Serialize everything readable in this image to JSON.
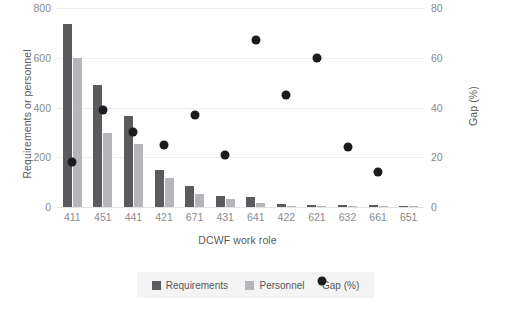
{
  "chart_data": {
    "type": "bar",
    "title": "",
    "xlabel": "DCWF work role",
    "ylabel": "Requirements or personnel",
    "y2label": "Gap (%)",
    "categories": [
      "411",
      "451",
      "441",
      "421",
      "671",
      "431",
      "641",
      "422",
      "621",
      "632",
      "661",
      "651"
    ],
    "ylim": [
      0,
      800
    ],
    "y2lim": [
      0,
      80
    ],
    "yticks": [
      "0",
      "200",
      "400",
      "600",
      "800"
    ],
    "y2ticks": [
      "0",
      "20",
      "40",
      "60",
      "80"
    ],
    "ytick_values": [
      0,
      200,
      400,
      600,
      800
    ],
    "y2tick_values": [
      0,
      20,
      40,
      60,
      80
    ],
    "grid": true,
    "legend_position": "bottom",
    "series": [
      {
        "name": "Requirements",
        "axis": "left",
        "kind": "bar",
        "color": "#5b5b5f",
        "values": [
          735,
          492,
          366,
          149,
          84,
          44,
          40,
          12,
          8,
          7,
          7,
          2
        ]
      },
      {
        "name": "Personnel",
        "axis": "left",
        "kind": "bar",
        "color": "#b6b6ba",
        "values": [
          599,
          297,
          253,
          117,
          52,
          32,
          16,
          4,
          2,
          2,
          2,
          1
        ]
      },
      {
        "name": "Gap (%)",
        "axis": "right",
        "kind": "scatter",
        "color": "#1c1c1e",
        "values": [
          18,
          39,
          30,
          25,
          37,
          21,
          67,
          45,
          60,
          24,
          14,
          null
        ]
      }
    ]
  },
  "legend": {
    "items": [
      {
        "label": "Requirements",
        "marker": "square",
        "color": "#5b5b5f"
      },
      {
        "label": "Personnel",
        "marker": "square",
        "color": "#b6b6ba"
      },
      {
        "label": "Gap (%)",
        "marker": "circle",
        "color": "#1c1c1e"
      }
    ]
  }
}
